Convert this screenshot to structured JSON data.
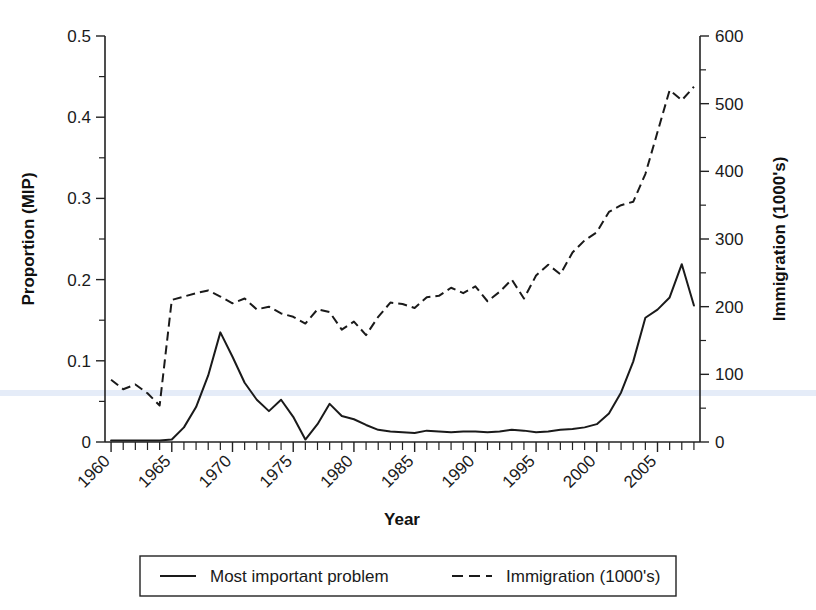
{
  "chart_data": {
    "type": "line",
    "title": "",
    "xlabel": "Year",
    "ylabel": "Proportion (MIP)",
    "y2label": "Immigration (1000's)",
    "xlim": [
      1959.5,
      2008.5
    ],
    "ylim": [
      0,
      0.5
    ],
    "y2lim": [
      0,
      600
    ],
    "grid": false,
    "legend_position": "bottom-center",
    "x_tick_labels": [
      "1960",
      "1965",
      "1970",
      "1975",
      "1980",
      "1985",
      "1990",
      "1995",
      "2000",
      "2005"
    ],
    "x_tick_values": [
      1960,
      1965,
      1970,
      1975,
      1980,
      1985,
      1990,
      1995,
      2000,
      2005
    ],
    "x_minor_ticks_every": 1,
    "y_tick_labels": [
      "0",
      "0.1",
      "0.2",
      "0.3",
      "0.4",
      "0.5"
    ],
    "y_tick_values": [
      0,
      0.1,
      0.2,
      0.3,
      0.4,
      0.5
    ],
    "y2_tick_labels": [
      "0",
      "100",
      "200",
      "300",
      "400",
      "500",
      "600"
    ],
    "y2_tick_values": [
      0,
      100,
      200,
      300,
      400,
      500,
      600
    ],
    "x": [
      1960,
      1961,
      1962,
      1963,
      1964,
      1965,
      1966,
      1967,
      1968,
      1969,
      1970,
      1971,
      1972,
      1973,
      1974,
      1975,
      1976,
      1977,
      1978,
      1979,
      1980,
      1981,
      1982,
      1983,
      1984,
      1985,
      1986,
      1987,
      1988,
      1989,
      1990,
      1991,
      1992,
      1993,
      1994,
      1995,
      1996,
      1997,
      1998,
      1999,
      2000,
      2001,
      2002,
      2003,
      2004,
      2005,
      2006,
      2007,
      2008
    ],
    "series": [
      {
        "name": "Most important problem",
        "axis": "left",
        "style": "solid",
        "values": [
          0.002,
          0.002,
          0.002,
          0.002,
          0.002,
          0.003,
          0.018,
          0.043,
          0.082,
          0.135,
          0.105,
          0.073,
          0.052,
          0.038,
          0.052,
          0.031,
          0.003,
          0.022,
          0.047,
          0.032,
          0.028,
          0.021,
          0.015,
          0.013,
          0.012,
          0.011,
          0.014,
          0.013,
          0.012,
          0.013,
          0.013,
          0.012,
          0.013,
          0.015,
          0.014,
          0.012,
          0.013,
          0.015,
          0.016,
          0.018,
          0.022,
          0.035,
          0.061,
          0.099,
          0.153,
          0.163,
          0.178,
          0.219,
          0.168
        ]
      },
      {
        "name": "Immigration (1000's)",
        "axis": "right",
        "style": "dashed",
        "values": [
          92,
          78,
          85,
          72,
          54,
          210,
          215,
          220,
          224,
          215,
          205,
          212,
          196,
          200,
          190,
          185,
          175,
          196,
          192,
          166,
          178,
          158,
          185,
          206,
          204,
          198,
          214,
          216,
          228,
          220,
          230,
          208,
          222,
          240,
          212,
          246,
          262,
          248,
          280,
          298,
          310,
          340,
          350,
          355,
          396,
          458,
          520,
          505,
          525
        ]
      }
    ]
  },
  "legend": {
    "entries": [
      {
        "label": "Most important problem",
        "style": "solid"
      },
      {
        "label": "Immigration (1000's)",
        "style": "dashed"
      }
    ]
  },
  "colors": {
    "line": "#1a1a1a",
    "axis": "#222222",
    "background": "#ffffff"
  }
}
